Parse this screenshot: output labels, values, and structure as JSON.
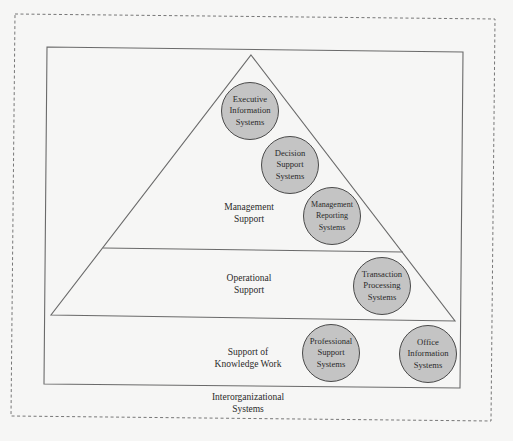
{
  "diagram": {
    "type": "pyramid-hierarchy",
    "colors": {
      "background": "#f6f6f5",
      "line": "#6a6a6a",
      "node_fill": "#c4c4c4",
      "node_stroke": "#4a4a4a",
      "text": "#2a2a2a"
    },
    "layers": [
      {
        "id": "management",
        "label": "Management\nSupport"
      },
      {
        "id": "operational",
        "label": "Operational\nSupport"
      },
      {
        "id": "knowledge",
        "label": "Support of\nKnowledge Work"
      },
      {
        "id": "interorganizational",
        "label": "Interorganizational\nSystems"
      }
    ],
    "nodes": [
      {
        "id": "eis",
        "label": "Executive\nInformation\nSystems",
        "layer": "management"
      },
      {
        "id": "dss",
        "label": "Decision\nSupport\nSystems",
        "layer": "management"
      },
      {
        "id": "mrs",
        "label": "Management\nReporting\nSystems",
        "layer": "management"
      },
      {
        "id": "tps",
        "label": "Transaction\nProcessing\nSystems",
        "layer": "operational"
      },
      {
        "id": "pss",
        "label": "Professional\nSupport\nSystems",
        "layer": "knowledge"
      },
      {
        "id": "ois",
        "label": "Office\nInformation\nSystems",
        "layer": "knowledge"
      }
    ]
  }
}
